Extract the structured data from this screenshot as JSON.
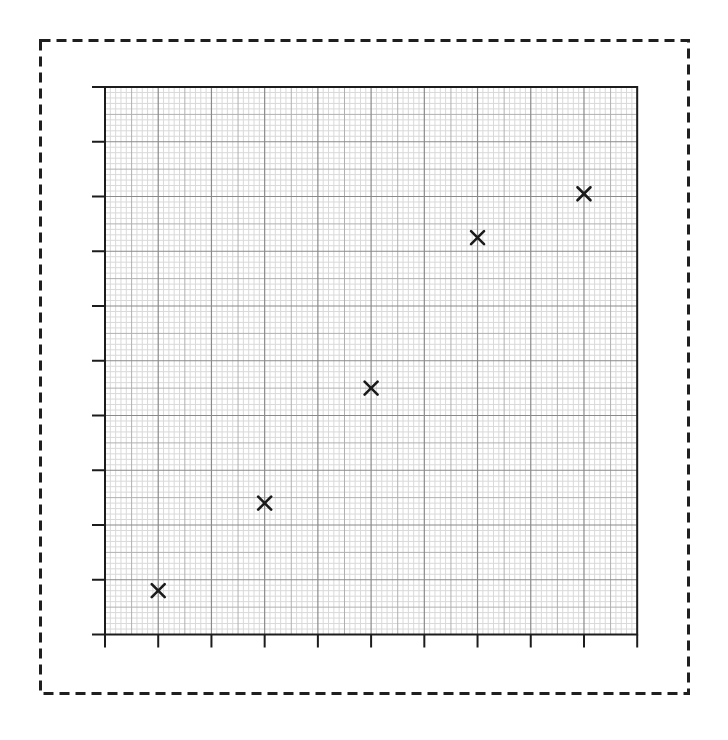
{
  "canvas": {
    "width": 728,
    "height": 740,
    "background": "#ffffff"
  },
  "chart_data": {
    "type": "scatter",
    "title": "",
    "subtitle": "",
    "xlabel": "",
    "ylabel": "",
    "x": [
      1,
      3,
      5,
      7,
      9
    ],
    "y": [
      0.8,
      2.4,
      4.5,
      7.25,
      8.05
    ],
    "points": [
      {
        "x": 1,
        "y": 0.8
      },
      {
        "x": 3,
        "y": 2.4
      },
      {
        "x": 5,
        "y": 4.5
      },
      {
        "x": 7,
        "y": 7.25
      },
      {
        "x": 9,
        "y": 8.05
      }
    ],
    "xlim": [
      0,
      10
    ],
    "ylim": [
      0,
      10
    ],
    "x_tick_step": 1,
    "y_tick_step": 1,
    "tick_labels": "none",
    "legend": "none",
    "grid": {
      "visible": true,
      "style": "graph-paper",
      "minor_step": 0.1,
      "medium_step": 0.5,
      "major_step": 1
    },
    "marker": {
      "symbol": "x",
      "size": 13,
      "stroke_width": 2.6,
      "color": "#1a1a1a"
    }
  },
  "layout": {
    "frame": {
      "style": "dashed",
      "color": "#1f1f1f",
      "thickness": 3,
      "dash_array": "10 6",
      "x": 40.5,
      "y": 40.5,
      "width": 648,
      "height": 653
    },
    "plot": {
      "left": 105,
      "top": 87,
      "width": 532.2,
      "height": 547.5
    },
    "ticks": {
      "length": 13,
      "stroke_width": 2
    },
    "colors": {
      "paper": "#ffffff",
      "grid_minor": "#d9d9d9",
      "grid_medium": "#b0b0b0",
      "grid_major": "#8a8a8a",
      "plot_border": "#1c1c1c",
      "tick": "#1c1c1c"
    }
  }
}
